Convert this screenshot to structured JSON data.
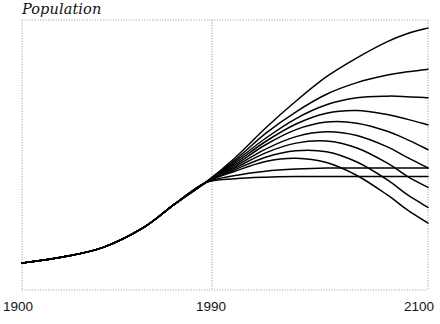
{
  "chart": {
    "ylabel": "Population",
    "xticks": [
      "1900",
      "1990",
      "2100"
    ]
  },
  "chart_data": {
    "type": "line",
    "title": "",
    "xlabel": "",
    "ylabel": "Population",
    "xlim": [
      1900,
      2100
    ],
    "ylim": [
      0,
      1
    ],
    "grid": false,
    "legend": "none",
    "tick_labels": {
      "x": [
        "1900",
        "1990",
        "2100"
      ],
      "y": []
    },
    "annotations": [
      {
        "type": "vertical-divider",
        "x": 1990,
        "label": "1990",
        "style": "dotted"
      }
    ],
    "x": [
      1900,
      1920,
      1940,
      1960,
      1975,
      1990,
      2005,
      2020,
      2035,
      2050,
      2065,
      2080,
      2090,
      2100
    ],
    "series": [
      {
        "name": "scenario-1-highest",
        "values": [
          0.1,
          0.122,
          0.158,
          0.232,
          0.317,
          0.396,
          0.49,
          0.6,
          0.7,
          0.79,
          0.86,
          0.92,
          0.95,
          0.97
        ]
      },
      {
        "name": "scenario-2-high",
        "values": [
          0.1,
          0.122,
          0.158,
          0.232,
          0.317,
          0.396,
          0.482,
          0.58,
          0.66,
          0.725,
          0.768,
          0.796,
          0.808,
          0.818
        ]
      },
      {
        "name": "scenario-3-high-plateau",
        "values": [
          0.1,
          0.122,
          0.158,
          0.232,
          0.317,
          0.396,
          0.476,
          0.562,
          0.635,
          0.686,
          0.712,
          0.718,
          0.716,
          0.712
        ]
      },
      {
        "name": "scenario-4-medium-high-peak",
        "values": [
          0.1,
          0.122,
          0.158,
          0.232,
          0.317,
          0.396,
          0.47,
          0.55,
          0.615,
          0.655,
          0.665,
          0.65,
          0.632,
          0.612
        ]
      },
      {
        "name": "scenario-5-medium-peak-decline",
        "values": [
          0.1,
          0.122,
          0.158,
          0.232,
          0.317,
          0.396,
          0.464,
          0.538,
          0.594,
          0.622,
          0.618,
          0.588,
          0.556,
          0.52
        ]
      },
      {
        "name": "scenario-6-medium-rounded",
        "values": [
          0.1,
          0.122,
          0.158,
          0.232,
          0.317,
          0.396,
          0.458,
          0.522,
          0.568,
          0.586,
          0.572,
          0.53,
          0.49,
          0.452
        ]
      },
      {
        "name": "scenario-7-medium-low",
        "values": [
          0.1,
          0.122,
          0.158,
          0.232,
          0.317,
          0.396,
          0.452,
          0.508,
          0.544,
          0.552,
          0.526,
          0.47,
          0.42,
          0.38
        ]
      },
      {
        "name": "scenario-8-low-decline",
        "values": [
          0.1,
          0.122,
          0.158,
          0.232,
          0.317,
          0.396,
          0.446,
          0.492,
          0.516,
          0.512,
          0.474,
          0.408,
          0.352,
          0.306
        ]
      },
      {
        "name": "scenario-9-lowest-decline",
        "values": [
          0.1,
          0.122,
          0.158,
          0.232,
          0.317,
          0.396,
          0.44,
          0.476,
          0.488,
          0.472,
          0.424,
          0.352,
          0.296,
          0.248
        ]
      },
      {
        "name": "scenario-10-flat-low",
        "values": [
          0.1,
          0.122,
          0.158,
          0.232,
          0.317,
          0.396,
          0.424,
          0.44,
          0.448,
          0.452,
          0.452,
          0.452,
          0.452,
          0.452
        ]
      },
      {
        "name": "scenario-11-shallow-rise",
        "values": [
          0.1,
          0.122,
          0.158,
          0.232,
          0.317,
          0.396,
          0.412,
          0.418,
          0.42,
          0.42,
          0.42,
          0.42,
          0.42,
          0.42
        ]
      }
    ]
  }
}
